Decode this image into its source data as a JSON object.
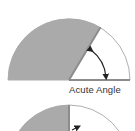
{
  "diagrams": [
    {
      "id": "acute",
      "label": "Acute Angle",
      "shape": "semicircle",
      "fill_color": "#a9a9a9",
      "stroke_color": "#8f8f8f",
      "angle_degrees": 60
    },
    {
      "id": "right",
      "label": "",
      "shape": "semicircle",
      "fill_color": "#a9a9a9",
      "stroke_color": "#8f8f8f",
      "angle_degrees": 90
    }
  ],
  "colors": {
    "background": "#ffffff",
    "shaded": "#a9a9a9",
    "outline": "#8f8f8f",
    "arrow": "#222222",
    "text": "#333333"
  }
}
